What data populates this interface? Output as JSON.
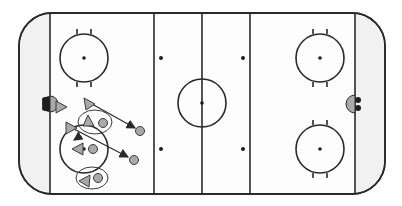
{
  "diagram": {
    "colors": {
      "background": "#ffffff",
      "ice": "#fdfdfd",
      "end_zone_fill": "#f1f1f1",
      "lines": "#2a2a2a",
      "marker_fill": "#a9a9a9",
      "marker_stroke": "#3a3a3a",
      "goal_dark": "#1e1e1e",
      "goal_light": "#a9a9a9"
    },
    "rink": {
      "zones": [
        "defending-end",
        "neutral-zone",
        "attacking-end"
      ],
      "faceoff_circles": [
        "upper-left",
        "lower-left",
        "center",
        "upper-right",
        "lower-right"
      ],
      "neutral_zone_dots": 4,
      "goals": [
        "left",
        "right"
      ]
    },
    "players": [
      {
        "id": "F1",
        "type": "forward-triangle",
        "label": "near left goal"
      },
      {
        "id": "F2",
        "type": "forward-triangle",
        "label": "top slot"
      },
      {
        "id": "F3",
        "type": "forward-triangle",
        "label": "circle top"
      },
      {
        "id": "F4",
        "type": "forward-triangle",
        "label": "circle left edge"
      },
      {
        "id": "F5",
        "type": "forward-triangle",
        "label": "circle center"
      },
      {
        "id": "F6",
        "type": "forward-triangle",
        "label": "bottom circle"
      },
      {
        "id": "D1",
        "type": "defender-circle",
        "label": "circle top-right"
      },
      {
        "id": "D2",
        "type": "defender-circle",
        "label": "circle center"
      },
      {
        "id": "D3",
        "type": "defender-circle",
        "label": "bottom"
      },
      {
        "id": "T1",
        "type": "target-circle",
        "label": "upper target"
      },
      {
        "id": "T2",
        "type": "target-circle",
        "label": "lower target"
      }
    ],
    "paths": [
      {
        "from": "F2",
        "to": "T1",
        "style": "arrow"
      },
      {
        "from": "F4",
        "to": "T2",
        "style": "arrow"
      },
      {
        "from": "F4",
        "to": "F5",
        "style": "short-arrow"
      }
    ]
  }
}
